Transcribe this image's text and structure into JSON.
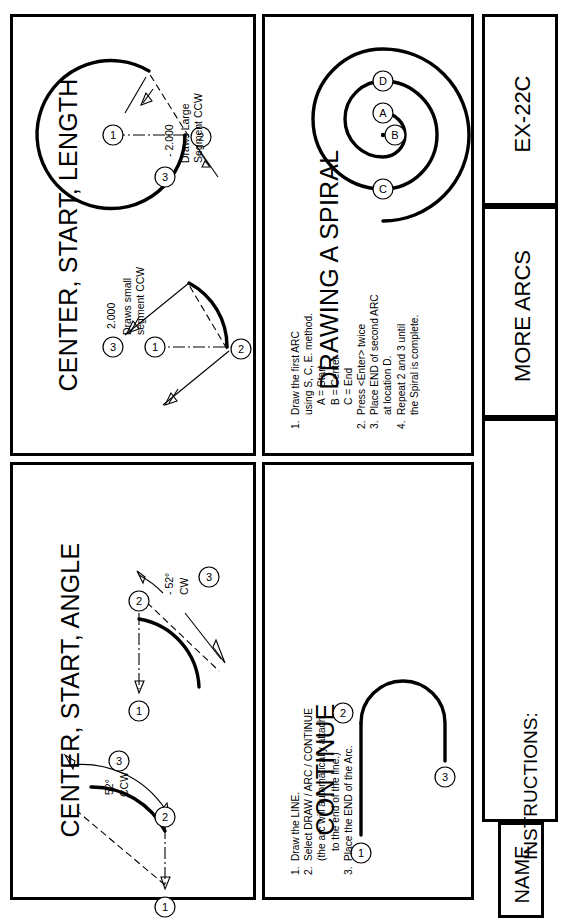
{
  "sheet": {
    "drawing_number": "EX-22C",
    "sheet_title": "MORE ARCS",
    "name_label": "NAME",
    "instructions_label": "INSTRUCTIONS:"
  },
  "panels": {
    "center_start_length": {
      "title": "CENTER, START, LENGTH",
      "left_figure": {
        "dim_value": "2.000",
        "note_line1": "Draws small",
        "note_line2": "segment CCW",
        "callouts": [
          "1",
          "2",
          "3"
        ]
      },
      "right_figure": {
        "dim_value": "- 2.000",
        "note_line1": "Draws Large",
        "note_line2": "Segment CCW",
        "callouts": [
          "1",
          "2",
          "3"
        ]
      }
    },
    "center_start_angle": {
      "title": "CENTER, START, ANGLE",
      "left_figure": {
        "angle_value": "52°",
        "direction": "CCW",
        "callouts": [
          "1",
          "2",
          "3"
        ]
      },
      "right_figure": {
        "angle_value": "- 52°",
        "direction": "CW",
        "callouts": [
          "1",
          "2",
          "3"
        ]
      }
    },
    "drawing_a_spiral": {
      "title": "DRAWING A SPIRAL",
      "figure_labels": [
        "A",
        "B",
        "C",
        "D"
      ],
      "steps": [
        {
          "num": "1.",
          "lines": [
            "Draw the first ARC",
            "using S, C, E. method.",
            "A = Start",
            "B = Center",
            "C = End"
          ]
        },
        {
          "num": "2.",
          "lines": [
            "Press <Enter> twice"
          ]
        },
        {
          "num": "3.",
          "lines": [
            "Place END of second ARC",
            "at location D."
          ]
        },
        {
          "num": "4.",
          "lines": [
            "Repeat 2 and 3 until",
            "the Spiral is complete."
          ]
        }
      ]
    },
    "continue": {
      "title": "CONTINUE",
      "callouts": [
        "1",
        "2",
        "3"
      ],
      "steps": [
        {
          "num": "1.",
          "lines": [
            "Draw the LINE."
          ]
        },
        {
          "num": "2.",
          "lines": [
            "Select DRAW / ARC / CONTINUE",
            "(the arc will automatically attach",
            "to the end of the line.)"
          ]
        },
        {
          "num": "3.",
          "lines": [
            "Place the END of the Arc."
          ]
        }
      ]
    }
  },
  "colors": {
    "ink": "#000000",
    "paper": "#ffffff"
  }
}
